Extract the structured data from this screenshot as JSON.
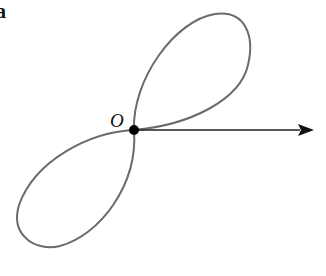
{
  "figure": {
    "panel_label": "a",
    "origin_label": "O",
    "curve_color": "#6b6b6b",
    "axis_color": "#222222",
    "point_color": "#000000"
  }
}
